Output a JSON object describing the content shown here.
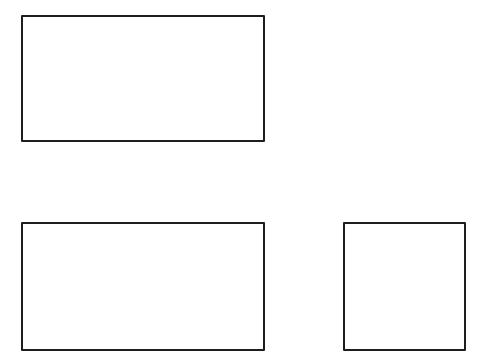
{
  "diagram": {
    "background": "#ffffff",
    "stroke_color": "#1e1e1e",
    "stroke_width": 2,
    "shapes": [
      {
        "id": "rect-top-left",
        "type": "rectangle",
        "x": 21,
        "y": 15,
        "width": 244,
        "height": 127,
        "label": ""
      },
      {
        "id": "rect-bottom-left",
        "type": "rectangle",
        "x": 21,
        "y": 222,
        "width": 244,
        "height": 129,
        "label": ""
      },
      {
        "id": "square-bottom-right",
        "type": "rectangle",
        "x": 343,
        "y": 222,
        "width": 123,
        "height": 129,
        "label": ""
      }
    ]
  }
}
